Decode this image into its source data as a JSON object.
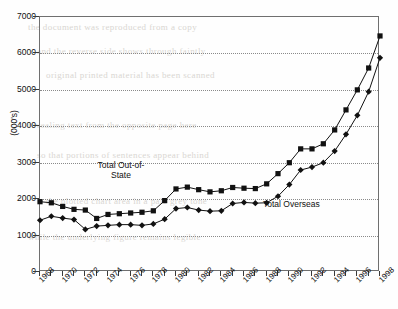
{
  "chart_data": {
    "type": "line",
    "title": "",
    "xlabel": "",
    "ylabel": "(000's)",
    "ylim": [
      0,
      7000
    ],
    "xlim": [
      1968,
      1998
    ],
    "grid": true,
    "legend_position": "inline-annotations",
    "ytick_labels": [
      "0",
      "1000",
      "2000",
      "3000",
      "4000",
      "5000",
      "6000",
      "7000"
    ],
    "ytick_values": [
      0,
      1000,
      2000,
      3000,
      4000,
      5000,
      6000,
      7000
    ],
    "xtick_labels": [
      "1968",
      "1970",
      "1972",
      "1974",
      "1976",
      "1978",
      "1980",
      "1982",
      "1984",
      "1986",
      "1988",
      "1990",
      "1992",
      "1994",
      "1996",
      "1998"
    ],
    "x": [
      1968,
      1969,
      1970,
      1971,
      1972,
      1973,
      1974,
      1975,
      1976,
      1977,
      1978,
      1979,
      1980,
      1981,
      1982,
      1983,
      1984,
      1985,
      1986,
      1987,
      1988,
      1989,
      1990,
      1991,
      1992,
      1993,
      1994,
      1995,
      1996,
      1997,
      1998
    ],
    "series": [
      {
        "name": "Total Out-of-State",
        "marker": "square",
        "values": [
          1930,
          1900,
          1800,
          1720,
          1700,
          1470,
          1580,
          1600,
          1620,
          1640,
          1680,
          1960,
          2280,
          2330,
          2260,
          2200,
          2230,
          2320,
          2300,
          2290,
          2420,
          2700,
          3000,
          3380,
          3380,
          3520,
          3900,
          4450,
          5000,
          5600,
          6480
        ]
      },
      {
        "name": "Total Overseas",
        "marker": "diamond",
        "values": [
          1420,
          1530,
          1480,
          1440,
          1170,
          1260,
          1280,
          1300,
          1300,
          1280,
          1320,
          1450,
          1740,
          1770,
          1700,
          1670,
          1680,
          1880,
          1910,
          1890,
          1900,
          2080,
          2400,
          2800,
          2880,
          3000,
          3320,
          3780,
          4300,
          4950,
          5880
        ]
      }
    ],
    "annotations": [
      {
        "name": "total-out-of-state-label",
        "text": "Total Out-of-\nState",
        "line1": "Total Out-of-",
        "line2": "State"
      },
      {
        "name": "total-overseas-label",
        "text": "Total Overseas"
      }
    ]
  },
  "bleed_text": [
    "the document was reproduced from a copy",
    "and the reverse side shows through faintly",
    "original printed material has been scanned",
    "revealing text from the opposite page here",
    "so that portions of sentences appear behind",
    "the plotted chart area in a pale grey tone",
    "while the underlying figure remains legible"
  ]
}
